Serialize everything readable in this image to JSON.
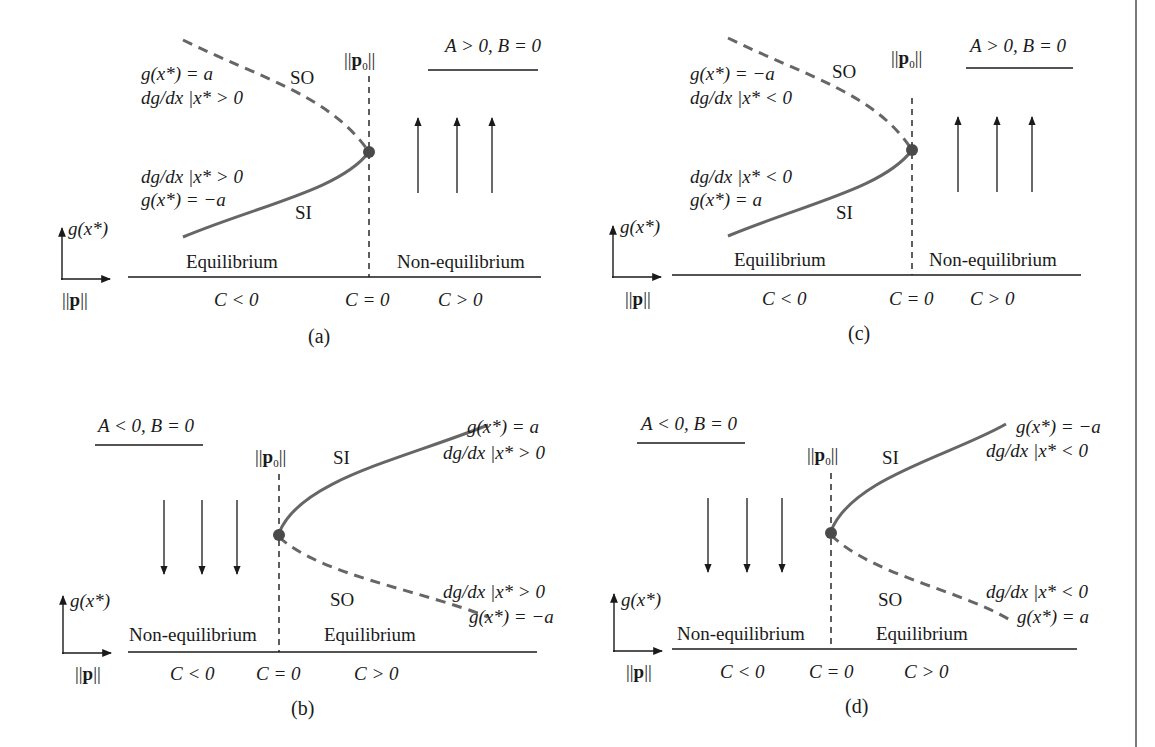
{
  "figure": {
    "border_color": "#7a7a7a",
    "curve_color": "#666666",
    "text_color": "#1a1a1a",
    "panels": [
      {
        "id": "a",
        "caption": "(a)",
        "condition": "A > 0, B = 0",
        "y_axis_label": "g(x*)",
        "x_axis_label": "||p||",
        "critical_label": "||p0||",
        "upper_branch": {
          "name": "SO",
          "style": "dashed",
          "g_value": "g(x*) = a",
          "slope": "dg/dx |x* > 0"
        },
        "lower_branch": {
          "name": "SI",
          "style": "solid",
          "g_value": "g(x*) = −a",
          "slope": "dg/dx |x* > 0"
        },
        "left_region": "Equilibrium",
        "right_region": "Non-equilibrium",
        "c_labels": [
          "C < 0",
          "C = 0",
          "C > 0"
        ],
        "arrow_direction": "up"
      },
      {
        "id": "b",
        "caption": "(b)",
        "condition": "A < 0, B = 0",
        "y_axis_label": "g(x*)",
        "x_axis_label": "||p||",
        "critical_label": "||p0||",
        "upper_branch": {
          "name": "SI",
          "style": "solid",
          "g_value": "g(x*) = a",
          "slope": "dg/dx |x* > 0"
        },
        "lower_branch": {
          "name": "SO",
          "style": "dashed",
          "g_value": "g(x*) = −a",
          "slope": "dg/dx |x* > 0"
        },
        "left_region": "Non-equilibrium",
        "right_region": "Equilibrium",
        "c_labels": [
          "C < 0",
          "C = 0",
          "C > 0"
        ],
        "arrow_direction": "down"
      },
      {
        "id": "c",
        "caption": "(c)",
        "condition": "A > 0, B = 0",
        "y_axis_label": "g(x*)",
        "x_axis_label": "||p||",
        "critical_label": "||p0||",
        "upper_branch": {
          "name": "SO",
          "style": "dashed",
          "g_value": "g(x*) = −a",
          "slope": "dg/dx |x* < 0"
        },
        "lower_branch": {
          "name": "SI",
          "style": "solid",
          "g_value": "g(x*) = a",
          "slope": "dg/dx |x* < 0"
        },
        "left_region": "Equilibrium",
        "right_region": "Non-equilibrium",
        "c_labels": [
          "C < 0",
          "C = 0",
          "C > 0"
        ],
        "arrow_direction": "up"
      },
      {
        "id": "d",
        "caption": "(d)",
        "condition": "A < 0, B = 0",
        "y_axis_label": "g(x*)",
        "x_axis_label": "||p||",
        "critical_label": "||p0||",
        "upper_branch": {
          "name": "SI",
          "style": "solid",
          "g_value": "g(x*) = −a",
          "slope": "dg/dx |x* < 0"
        },
        "lower_branch": {
          "name": "SO",
          "style": "dashed",
          "g_value": "g(x*) = a",
          "slope": "dg/dx |x* < 0"
        },
        "left_region": "Non-equilibrium",
        "right_region": "Equilibrium",
        "c_labels": [
          "C < 0",
          "C = 0",
          "C > 0"
        ],
        "arrow_direction": "down"
      }
    ]
  },
  "text": {
    "so": "SO",
    "si": "SI",
    "equilibrium": "Equilibrium",
    "non_equilibrium": "Non-equilibrium",
    "c_lt": "C",
    "op_lt": " < 0",
    "op_eq": " = 0",
    "op_gt": " > 0",
    "a_cond_pos": "A > 0, B = 0",
    "a_cond_neg": "A < 0, B = 0",
    "g_a": "g(x*) = a",
    "g_neg_a": "g(x*) = −a",
    "dg": "dg/dx |",
    "x_star": "x*",
    "gt0": " > 0",
    "lt0": " < 0",
    "gx": "g(x*)",
    "norm_bars": "||",
    "p": "p",
    "zero": "0",
    "cap_a": "(a)",
    "cap_b": "(b)",
    "cap_c": "(c)",
    "cap_d": "(d)"
  }
}
